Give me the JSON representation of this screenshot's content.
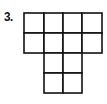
{
  "problem": {
    "number_label": "3."
  },
  "figure": {
    "type": "unit-square grid shape",
    "line_color": "#111111",
    "fill_color": "#ffffff",
    "rows": [
      {
        "row": 1,
        "filled_columns": [
          1,
          2,
          3,
          4
        ]
      },
      {
        "row": 2,
        "filled_columns": [
          1,
          2,
          3,
          4
        ]
      },
      {
        "row": 3,
        "filled_columns": [
          2,
          3
        ]
      },
      {
        "row": 4,
        "filled_columns": [
          2,
          3
        ]
      }
    ],
    "total_squares": 12
  }
}
